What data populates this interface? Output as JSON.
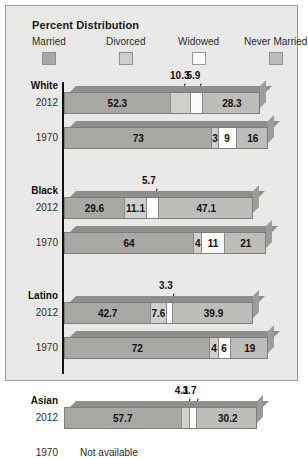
{
  "title": "Percent Distribution",
  "legend": {
    "items": [
      {
        "label": "Married",
        "color": "#a8a8a5"
      },
      {
        "label": "Divorced",
        "color": "#cfcfcc"
      },
      {
        "label": "Widowed",
        "color": "#fbfbf9"
      },
      {
        "label": "Never Married",
        "color": "#bdbdba"
      }
    ]
  },
  "not_available_text": "Not available",
  "chart_data": {
    "type": "bar",
    "subtype": "stacked-horizontal-3d",
    "title": "Percent Distribution",
    "xlabel": "",
    "ylabel": "",
    "xlim": [
      0,
      100
    ],
    "grid": false,
    "legend_position": "top",
    "categories": [
      "Married",
      "Divorced",
      "Widowed",
      "Never Married"
    ],
    "groups": [
      {
        "name": "White",
        "rows": [
          {
            "year": "2012",
            "available": true,
            "values": [
              52.3,
              10.3,
              5.9,
              28.3
            ],
            "labels": [
              "52.3",
              "10.3",
              "5.9",
              "28.3"
            ],
            "callouts": [
              "Divorced",
              "Widowed"
            ]
          },
          {
            "year": "1970",
            "available": true,
            "values": [
              73,
              3,
              9,
              16
            ],
            "labels": [
              "73",
              "3",
              "9",
              "16"
            ],
            "callouts": []
          }
        ]
      },
      {
        "name": "Black",
        "rows": [
          {
            "year": "2012",
            "available": true,
            "values": [
              29.6,
              11.1,
              5.7,
              47.1
            ],
            "labels": [
              "29.6",
              "11.1",
              "5.7",
              "47.1"
            ],
            "callouts": [
              "Widowed"
            ]
          },
          {
            "year": "1970",
            "available": true,
            "values": [
              64,
              4,
              11,
              21
            ],
            "labels": [
              "64",
              "4",
              "11",
              "21"
            ],
            "callouts": []
          }
        ]
      },
      {
        "name": "Latino",
        "rows": [
          {
            "year": "2012",
            "available": true,
            "values": [
              42.7,
              7.6,
              3.3,
              39.9
            ],
            "labels": [
              "42.7",
              "7.6",
              "3.3",
              "39.9"
            ],
            "callouts": [
              "Widowed"
            ]
          },
          {
            "year": "1970",
            "available": true,
            "values": [
              72,
              4,
              6,
              19
            ],
            "labels": [
              "72",
              "4",
              "6",
              "19"
            ],
            "callouts": []
          }
        ]
      },
      {
        "name": "Asian",
        "rows": [
          {
            "year": "2012",
            "available": true,
            "values": [
              57.7,
              4.1,
              3.7,
              30.2
            ],
            "labels": [
              "57.7",
              "4.1",
              "3.7",
              "30.2"
            ],
            "callouts": [
              "Divorced",
              "Widowed"
            ]
          },
          {
            "year": "1970",
            "available": false,
            "values": [],
            "labels": [],
            "callouts": []
          }
        ]
      }
    ]
  }
}
